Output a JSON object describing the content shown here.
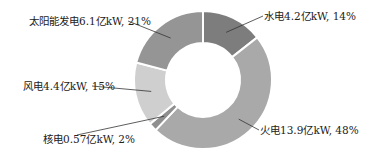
{
  "chart_data": {
    "type": "pie",
    "variant": "donut",
    "title": "",
    "unit": "亿kW",
    "categories": [
      "水电",
      "火电",
      "核电",
      "风电",
      "太阳能发电"
    ],
    "values": [
      4.2,
      13.9,
      0.57,
      4.4,
      6.1
    ],
    "percentages": [
      14,
      48,
      2,
      15,
      21
    ],
    "labels": [
      "水电4.2亿kW, 14%",
      "火电13.9亿kW, 48%",
      "核电0.57亿kW, 2%",
      "风电4.4亿kW, 15%",
      "太阳能发电6.1亿kW, 21%"
    ],
    "colors": [
      "#7d7d7d",
      "#a9a9a9",
      "#8f8f8f",
      "#cfcfcf",
      "#959595"
    ],
    "start_angle_deg": 0,
    "direction": "clockwise",
    "legend": "none",
    "grid": false
  }
}
